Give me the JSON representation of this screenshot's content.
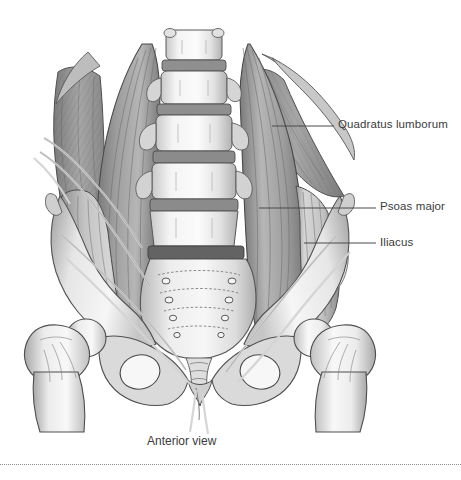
{
  "figure": {
    "width": 461,
    "height": 480,
    "background_color": "#ffffff",
    "caption": "Anterior view"
  },
  "labels": [
    {
      "id": "quadratus-lumborum",
      "text": "Quadratus lumborum",
      "leader": {
        "x1": 272,
        "y1": 126,
        "x2": 334,
        "y2": 126
      }
    },
    {
      "id": "psoas-major",
      "text": "Psoas major",
      "leader": {
        "x1": 259,
        "y1": 208,
        "x2": 376,
        "y2": 208
      }
    },
    {
      "id": "iliacus",
      "text": "Iliacus",
      "leader": {
        "x1": 304,
        "y1": 243,
        "x2": 376,
        "y2": 243
      }
    }
  ],
  "colors": {
    "label_text": "#3b3b3b",
    "leader_line": "#4a4a4a",
    "rule": "#8e8e8e",
    "bone_light": "#f2f2f2",
    "bone_mid": "#d8d8d8",
    "bone_shadow": "#9a9a9a",
    "muscle_light": "#b4b4b4",
    "muscle_mid": "#8f8f8f",
    "muscle_dark": "#6a6a6a",
    "outline": "#4f4f4f",
    "nerve": "#cfcfcf"
  },
  "structures": {
    "vertebrae_count": 5,
    "sacral_foramina_pairs": 4,
    "named_parts": [
      "lumbar vertebrae",
      "sacrum",
      "ilium",
      "pubic symphysis",
      "obturator foramen",
      "femoral head",
      "greater trochanter",
      "femur shaft",
      "lumbar plexus nerves"
    ]
  }
}
